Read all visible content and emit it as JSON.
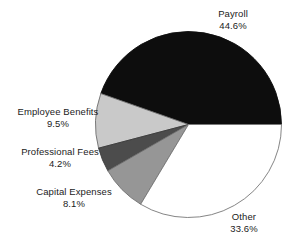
{
  "chart_data": {
    "type": "pie",
    "title": "",
    "subtitle": "",
    "xlabel": "",
    "ylabel": "",
    "legend_position": "none",
    "grid": false,
    "units": "percent",
    "start_angle_deg": 0,
    "direction": "counterclockwise",
    "categories": [
      "Payroll",
      "Other",
      "Capital Expenses",
      "Professional Fees",
      "Employee Benefits"
    ],
    "values": [
      44.6,
      33.6,
      8.1,
      4.2,
      9.5
    ],
    "slices": [
      {
        "label": "Payroll",
        "value": 44.6,
        "value_text": "44.6%",
        "color": "#0d0d0d",
        "stroke": "#0d0d0d",
        "start_deg": 0,
        "end_deg": 160.56,
        "label_align": "center"
      },
      {
        "label": "Employee Benefits",
        "value": 9.5,
        "value_text": "9.5%",
        "color": "#c9c9c9",
        "stroke": "#6e6e6e",
        "start_deg": 160.56,
        "end_deg": 194.76,
        "label_align": "center"
      },
      {
        "label": "Professional Fees",
        "value": 4.2,
        "value_text": "4.2%",
        "color": "#4c4c4c",
        "stroke": "#3a3a3a",
        "start_deg": 194.76,
        "end_deg": 209.88,
        "label_align": "center"
      },
      {
        "label": "Capital Expenses",
        "value": 8.1,
        "value_text": "8.1%",
        "color": "#969696",
        "stroke": "#6e6e6e",
        "start_deg": 209.88,
        "end_deg": 239.04,
        "label_align": "center"
      },
      {
        "label": "Other",
        "value": 33.6,
        "value_text": "33.6%",
        "color": "#ffffff",
        "stroke": "#777777",
        "start_deg": 239.04,
        "end_deg": 360,
        "label_align": "center"
      }
    ],
    "geometry": {
      "center_x": 188.5,
      "center_y": 124.5,
      "radius": 93
    },
    "background_color": "#ffffff",
    "text_color": "#1b1b1b"
  },
  "labels": {
    "payroll": {
      "name": "Payroll",
      "value": "44.6%"
    },
    "other": {
      "name": "Other",
      "value": "33.6%"
    },
    "employee_benefits": {
      "name": "Employee Benefits",
      "value": "9.5%"
    },
    "professional_fees": {
      "name": "Professional Fees",
      "value": "4.2%"
    },
    "capital_expenses": {
      "name": "Capital Expenses",
      "value": "8.1%"
    }
  }
}
